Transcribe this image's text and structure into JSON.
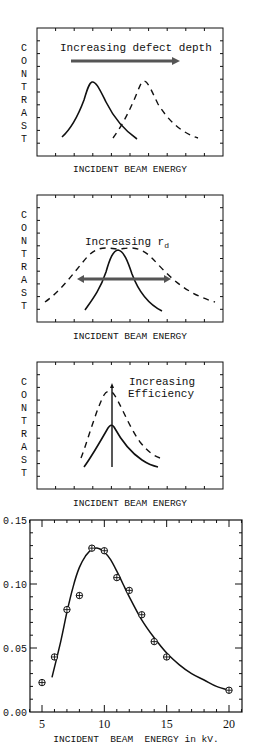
{
  "chart_data": [
    {
      "type": "line",
      "title": "",
      "annotation": "Increasing defect depth",
      "ylabel": "CONTRAST",
      "xlabel": "INCIDENT BEAM ENERGY",
      "grid": false,
      "series": [
        {
          "name": "shallow defect",
          "style": "solid",
          "shape": "peak",
          "peak_x_frac": 0.3,
          "peak_y_frac": 0.65
        },
        {
          "name": "deeper defect",
          "style": "dashed",
          "shape": "peak",
          "peak_x_frac": 0.57,
          "peak_y_frac": 0.65
        }
      ],
      "arrow": {
        "direction": "right"
      }
    },
    {
      "type": "line",
      "title": "",
      "annotation": "Increasing r",
      "annotation_subscript": "d",
      "ylabel": "CONTRAST",
      "xlabel": "INCIDENT BEAM ENERGY",
      "grid": false,
      "series": [
        {
          "name": "small r_d",
          "style": "solid",
          "shape": "narrow peak",
          "peak_x_frac": 0.44
        },
        {
          "name": "large r_d",
          "style": "dashed",
          "shape": "broad peak",
          "peak_x_frac": 0.44
        }
      ],
      "arrow": {
        "direction": "both"
      }
    },
    {
      "type": "line",
      "title": "",
      "annotation": "Increasing Efficiency",
      "ylabel": "CONTRAST",
      "xlabel": "INCIDENT BEAM ENERGY",
      "grid": false,
      "series": [
        {
          "name": "lower efficiency",
          "style": "solid",
          "shape": "peak",
          "peak_x_frac": 0.4
        },
        {
          "name": "higher efficiency",
          "style": "dashed",
          "shape": "taller peak",
          "peak_x_frac": 0.4
        }
      ],
      "arrow": {
        "direction": "up"
      }
    },
    {
      "type": "scatter",
      "title": "",
      "xlabel": "INCIDENT BEAM ENERGY in kV.",
      "ylabel": "",
      "xlim": [
        4,
        21
      ],
      "ylim": [
        0.0,
        0.15
      ],
      "xticks": [
        5,
        10,
        15,
        20
      ],
      "yticks": [
        0.0,
        0.05,
        0.1,
        0.15
      ],
      "grid": false,
      "series": [
        {
          "name": "measured",
          "marker": "circled-plus",
          "x": [
            5,
            6,
            7,
            8,
            9,
            10,
            11,
            12,
            13,
            14,
            15,
            20
          ],
          "y": [
            0.023,
            0.043,
            0.08,
            0.091,
            0.128,
            0.126,
            0.105,
            0.095,
            0.076,
            0.055,
            0.043,
            0.017
          ]
        },
        {
          "name": "fit",
          "style": "solid line",
          "x": [
            5.8,
            6.5,
            7,
            7.5,
            8,
            8.5,
            9,
            9.5,
            10,
            10.5,
            11,
            11.5,
            12,
            13,
            14,
            15,
            16,
            17,
            18,
            19,
            20
          ],
          "y": [
            0.027,
            0.055,
            0.078,
            0.098,
            0.113,
            0.122,
            0.127,
            0.128,
            0.125,
            0.119,
            0.11,
            0.1,
            0.09,
            0.072,
            0.058,
            0.046,
            0.037,
            0.03,
            0.025,
            0.02,
            0.017
          ]
        }
      ]
    }
  ],
  "panels": {
    "p1": {
      "ylabel_letters": [
        "C",
        "O",
        "N",
        "T",
        "R",
        "A",
        "S",
        "T"
      ],
      "xlabel": "INCIDENT BEAM ENERGY",
      "annotation": "Increasing defect depth"
    },
    "p2": {
      "ylabel_letters": [
        "C",
        "O",
        "N",
        "T",
        "R",
        "A",
        "S",
        "T"
      ],
      "xlabel": "INCIDENT BEAM ENERGY",
      "annotation": "Increasing r",
      "annotation_sub": "d"
    },
    "p3": {
      "ylabel_letters": [
        "C",
        "O",
        "N",
        "T",
        "R",
        "A",
        "S",
        "T"
      ],
      "xlabel": "INCIDENT BEAM ENERGY",
      "annotation_line1": "Increasing",
      "annotation_line2": "Efficiency"
    },
    "p4": {
      "xlabel": "INCIDENT  BEAM  ENERGY in kV.",
      "xtick_labels": [
        "5",
        "10",
        "15",
        "20"
      ],
      "ytick_labels": [
        "0.00",
        "0.05",
        "0.10",
        "0.15"
      ]
    }
  },
  "colors": {
    "ink": "#111111",
    "arrow": "#555555"
  }
}
